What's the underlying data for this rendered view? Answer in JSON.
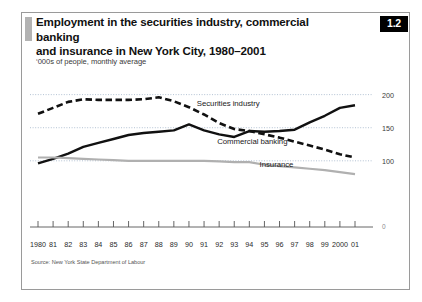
{
  "figure": {
    "badge": "1.2",
    "title": "Employment in the securities industry, commercial banking and insurance in New York City, 1980–2001",
    "title_line1": "Employment in the securities industry, commercial banking",
    "title_line2": "and insurance in New York City, 1980–2001",
    "subtitle": "‘000s of people, monthly average",
    "source": "Source: New York State Department of Labour",
    "accent_color": "#b3b3b3",
    "frame_color": "#9a9a9a",
    "badge_bg": "#000000",
    "badge_fg": "#ffffff"
  },
  "chart_data": {
    "type": "line",
    "title": "Employment in the securities industry, commercial banking and insurance in New York City, 1980–2001",
    "subtitle": "‘000s of people, monthly average",
    "xlabel": "",
    "ylabel": "'000s of people",
    "ylim": [
      0,
      210
    ],
    "yticks": [
      0,
      100,
      150,
      200
    ],
    "ytick_labels": [
      "0",
      "100",
      "150",
      "200"
    ],
    "grid": "horizontal-dotted",
    "legend": "inline-annotations",
    "x": [
      1980,
      1981,
      1982,
      1983,
      1984,
      1985,
      1986,
      1987,
      1988,
      1989,
      1990,
      1991,
      1992,
      1993,
      1994,
      1995,
      1996,
      1997,
      1998,
      1999,
      2000,
      2001
    ],
    "categories": [
      "1980",
      "81",
      "82",
      "83",
      "84",
      "85",
      "86",
      "87",
      "88",
      "89",
      "90",
      "91",
      "92",
      "93",
      "94",
      "95",
      "96",
      "97",
      "98",
      "99",
      "2000",
      "01"
    ],
    "series": [
      {
        "name": "Securities industry",
        "style": "solid",
        "color": "#111111",
        "label_x": 1992.6,
        "label_y": 186,
        "values": [
          96,
          103,
          111,
          121,
          127,
          133,
          139,
          142,
          144,
          146,
          155,
          146,
          140,
          136,
          145,
          144,
          145,
          147,
          158,
          168,
          180,
          184
        ]
      },
      {
        "name": "Commercial banking",
        "style": "dashed",
        "color": "#111111",
        "label_x": 1994.2,
        "label_y": 128,
        "values": [
          171,
          180,
          189,
          193,
          192,
          192,
          192,
          193,
          196,
          190,
          181,
          170,
          157,
          148,
          145,
          140,
          135,
          129,
          123,
          117,
          110,
          105
        ]
      },
      {
        "name": "Insurance",
        "style": "solid",
        "color": "#b0b0b0",
        "label_x": 1995.8,
        "label_y": 93,
        "values": [
          105,
          105,
          104,
          103,
          102,
          101,
          100,
          100,
          100,
          100,
          100,
          100,
          99,
          98,
          98,
          94,
          92,
          90,
          88,
          86,
          83,
          80
        ]
      }
    ]
  }
}
